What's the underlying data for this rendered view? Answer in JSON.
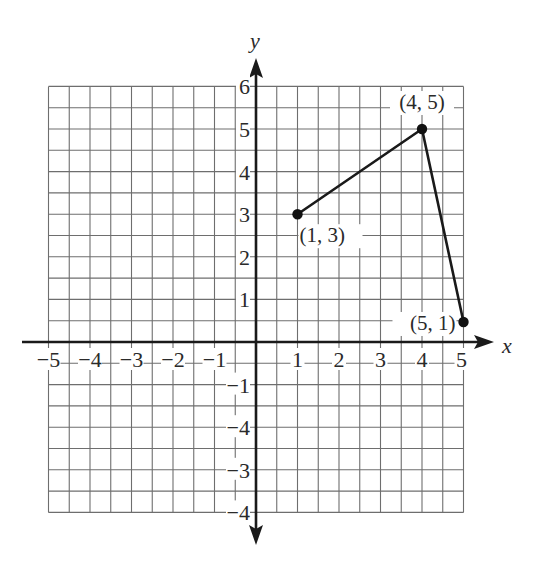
{
  "chart_data": {
    "type": "line",
    "title": "",
    "xlabel": "x",
    "ylabel": "y",
    "xlim": [
      -5,
      5
    ],
    "ylim": [
      -4,
      6
    ],
    "grid": true,
    "grid_step": 0.5,
    "x_ticks": [
      {
        "value": -5,
        "label": "−5"
      },
      {
        "value": -4,
        "label": "−4"
      },
      {
        "value": -3,
        "label": "−3"
      },
      {
        "value": -2,
        "label": "−2"
      },
      {
        "value": -1,
        "label": "−1"
      },
      {
        "value": 1,
        "label": "1"
      },
      {
        "value": 2,
        "label": "2"
      },
      {
        "value": 3,
        "label": "3"
      },
      {
        "value": 4,
        "label": "4"
      },
      {
        "value": 5,
        "label": "5"
      }
    ],
    "y_ticks": [
      {
        "value": 6,
        "label": "6"
      },
      {
        "value": 5,
        "label": "5"
      },
      {
        "value": 4,
        "label": "4"
      },
      {
        "value": 3,
        "label": "3"
      },
      {
        "value": 2,
        "label": "2"
      },
      {
        "value": 1,
        "label": "1"
      },
      {
        "value": -1,
        "label": "−1"
      },
      {
        "value": -2,
        "label": "−4"
      },
      {
        "value": -3,
        "label": "−3"
      },
      {
        "value": -4,
        "label": "−4"
      }
    ],
    "series": [
      {
        "name": "polyline",
        "points": [
          {
            "x": 1,
            "y": 3,
            "label": "(1, 3)",
            "plot_x": 1,
            "plot_y": 3
          },
          {
            "x": 4,
            "y": 5,
            "label": "(4, 5)",
            "plot_x": 4,
            "plot_y": 5
          },
          {
            "x": 5,
            "y": 1,
            "label": "(5, 1)",
            "plot_x": 5,
            "plot_y": 0.47
          }
        ]
      }
    ],
    "colors": {
      "grid": "#6e6e6e",
      "axis": "#1a1a1a",
      "line": "#1a1a1a",
      "point": "#111111",
      "text": "#2a2a2a"
    },
    "legend": null
  }
}
